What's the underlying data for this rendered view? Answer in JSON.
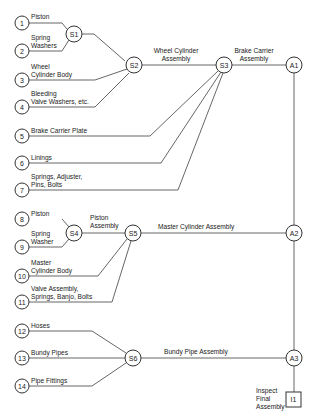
{
  "parts": [
    {
      "id": "1",
      "lines": [
        "Piston"
      ]
    },
    {
      "id": "2",
      "lines": [
        "Spring",
        "Washers"
      ]
    },
    {
      "id": "3",
      "lines": [
        "Wheel",
        "Cylinder Body"
      ]
    },
    {
      "id": "4",
      "lines": [
        "Bleeding",
        "Valve Washers, etc."
      ]
    },
    {
      "id": "5",
      "lines": [
        "Brake Carrier Plate"
      ]
    },
    {
      "id": "6",
      "lines": [
        "Linings"
      ]
    },
    {
      "id": "7",
      "lines": [
        "Springs, Adjuster,",
        "Pins, Bolts"
      ]
    },
    {
      "id": "8",
      "lines": [
        "Piston"
      ]
    },
    {
      "id": "9",
      "lines": [
        "Spring",
        "Washer"
      ]
    },
    {
      "id": "10",
      "lines": [
        "Master",
        "Cylinder Body"
      ]
    },
    {
      "id": "11",
      "lines": [
        "Valve Assembly,",
        "Springs, Banjo, Bolts"
      ]
    },
    {
      "id": "12",
      "lines": [
        "Hoses"
      ]
    },
    {
      "id": "13",
      "lines": [
        "Bundy Pipes"
      ]
    },
    {
      "id": "14",
      "lines": [
        "Pipe Fittings"
      ]
    }
  ],
  "subassemblies": {
    "S1": "S1",
    "S2": "S2",
    "S3": "S3",
    "S4": "S4",
    "S5": "S5",
    "S6": "S6"
  },
  "assemblies": {
    "A1": "A1",
    "A2": "A2",
    "A3": "A3"
  },
  "inspection": {
    "id": "I1",
    "lines": [
      "Inspect",
      "Final",
      "Assembly"
    ]
  },
  "edge_labels": {
    "wheel_cylinder": [
      "Wheel Cylinder",
      "Assembly"
    ],
    "brake_carrier": [
      "Brake Carrier",
      "Assembly"
    ],
    "piston_assembly": [
      "Piston",
      "Assembly"
    ],
    "master_cylinder": "Master Cylinder Assembly",
    "bundy_pipe": "Bundy Pipe Assembly"
  }
}
